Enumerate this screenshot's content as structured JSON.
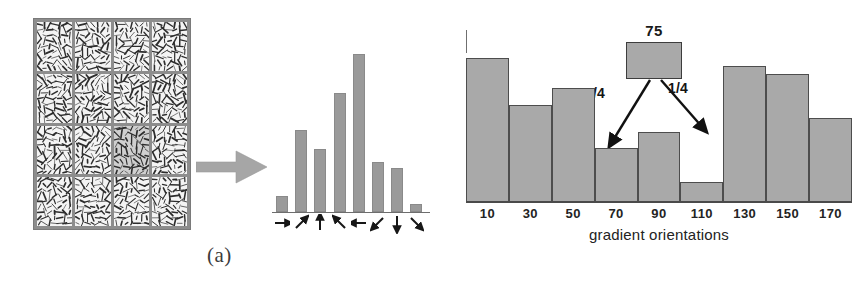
{
  "figure": {
    "panel_a_label": "(a)",
    "panel_b_label": "(b)"
  },
  "panel_a": {
    "grid": {
      "rows": 4,
      "cols": 4,
      "highlight_row": 3,
      "highlight_col": 3,
      "cell_color": "#f4f4f4",
      "highlight_color": "#cfcfcf",
      "border_color": "#8d8d8d",
      "description": "image gradients"
    },
    "transfer_arrow_icon": "block-arrow-right",
    "orientation_histogram": {
      "type": "bar",
      "categories": [
        "right",
        "up-right",
        "up",
        "up-left",
        "left",
        "down-left",
        "down",
        "down-right"
      ],
      "arrow_glyphs": [
        "arrow-right",
        "arrow-up-right",
        "arrow-up",
        "arrow-up-left",
        "arrow-left",
        "arrow-down-left",
        "arrow-down",
        "arrow-down-right"
      ],
      "values": [
        16,
        80,
        61,
        116,
        154,
        49,
        43,
        8
      ],
      "ylim": [
        0,
        160
      ],
      "bar_color": "#9a9a9a",
      "title": "",
      "xlabel": "",
      "ylabel": ""
    }
  },
  "panel_b": {
    "chart": {
      "xlabel": "gradient orientations",
      "tick_labels": [
        "10",
        "30",
        "50",
        "70",
        "90",
        "110",
        "130",
        "150",
        "170"
      ]
    },
    "callout": {
      "value": "75",
      "split_left": "3/4",
      "split_right": "1/4"
    }
  },
  "chart_data": [
    {
      "type": "bar",
      "id": "panel-a-orientation-histogram",
      "title": "",
      "categories": [
        "→",
        "↗",
        "↑",
        "↖",
        "←",
        "↙",
        "↓",
        "↘"
      ],
      "values": [
        16,
        80,
        61,
        116,
        154,
        49,
        43,
        8
      ],
      "xlabel": "",
      "ylabel": "",
      "ylim": [
        0,
        160
      ],
      "grid": false,
      "legend": "none"
    },
    {
      "type": "bar",
      "id": "panel-b-gradient-orientation-histogram",
      "title": "",
      "categories": [
        "10",
        "30",
        "50",
        "70",
        "90",
        "110",
        "130",
        "150",
        "170"
      ],
      "values": [
        145,
        98,
        115,
        54,
        70,
        20,
        137,
        129,
        85
      ],
      "xlabel": "gradient orientations",
      "ylabel": "",
      "ylim": [
        0,
        172
      ],
      "grid": false,
      "legend": "none",
      "annotations": [
        {
          "text": "75",
          "type": "callout-box-value"
        },
        {
          "text": "3/4",
          "type": "split-weight",
          "target_bin": "70"
        },
        {
          "text": "1/4",
          "type": "split-weight",
          "target_bin": "90"
        }
      ]
    }
  ]
}
